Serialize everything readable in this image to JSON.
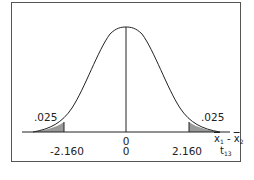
{
  "diagram": {
    "type": "t-distribution two-tailed test",
    "tail_area_left": ".025",
    "tail_area_right": ".025",
    "axis1": {
      "variable": "x̄1 - x̄2",
      "var_x1": "x",
      "var_x1_sub": "1",
      "minus": " - ",
      "var_x2": "x",
      "var_x2_sub": "2",
      "center": "0"
    },
    "axis2": {
      "variable": "t13",
      "var_t": "t",
      "var_t_sub": "13",
      "left_critical": "-2.160",
      "center": "0",
      "right_critical": "2.160"
    },
    "colors": {
      "shade": "#9a9a9a",
      "line": "#222222",
      "frame": "#555555"
    }
  }
}
